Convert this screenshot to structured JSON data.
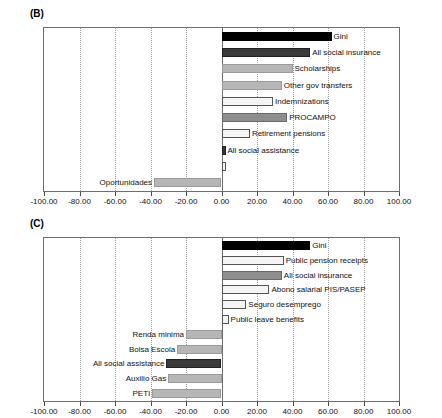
{
  "figure": {
    "panels": [
      {
        "id": "B",
        "label": "(B)",
        "axis": {
          "min": -100,
          "max": 100,
          "ticks": [
            -100,
            -80,
            -60,
            -40,
            -20,
            0,
            20,
            40,
            60,
            80,
            100
          ],
          "tick_labels": [
            "-100.00",
            "-80.00",
            "-60.00",
            "-40.00",
            "-20.00",
            "0.00",
            "20.00",
            "40.00",
            "60.00",
            "80.00",
            "100.00"
          ]
        },
        "bars": [
          {
            "label": "Gini",
            "value": 62,
            "style": "fill-black"
          },
          {
            "label": "All social insurance",
            "value": 50,
            "style": "fill-dark"
          },
          {
            "label": "Scholarships",
            "value": 40,
            "style": "fill-light"
          },
          {
            "label": "Other gov transfers",
            "value": 34,
            "style": "fill-light"
          },
          {
            "label": "Indemnizations",
            "value": 29,
            "style": "fill-hollow"
          },
          {
            "label": "PROCAMPO",
            "value": 37,
            "style": "fill-mid"
          },
          {
            "label": "Retirement pensions",
            "value": 16,
            "style": "fill-hollow"
          },
          {
            "label": "All social assistance",
            "value": 2,
            "style": "fill-dark"
          },
          {
            "label": "",
            "value": 0,
            "style": "fill-hollow"
          },
          {
            "label": "Oportunidades",
            "value": -38,
            "style": "fill-light"
          }
        ]
      },
      {
        "id": "C",
        "label": "(C)",
        "axis": {
          "min": -100,
          "max": 100,
          "ticks": [
            -100,
            -80,
            -60,
            -40,
            -20,
            0,
            20,
            40,
            60,
            80,
            100
          ],
          "tick_labels": [
            "-100.00",
            "-80.00",
            "-60.00",
            "-40.00",
            "-20.00",
            "0.00",
            "20.00",
            "40.00",
            "60.00",
            "80.00",
            "100.00"
          ]
        },
        "bars": [
          {
            "label": "Gini",
            "value": 50,
            "style": "fill-black"
          },
          {
            "label": "Public pension receipts",
            "value": 35,
            "style": "fill-hollow"
          },
          {
            "label": "All social insurance",
            "value": 34,
            "style": "fill-mid"
          },
          {
            "label": "Abono salarial PIS/PASEP",
            "value": 27,
            "style": "fill-hollow"
          },
          {
            "label": "Seguro desemprego",
            "value": 14,
            "style": "fill-hollow"
          },
          {
            "label": "Public leave benefits",
            "value": 4,
            "style": "fill-hollow"
          },
          {
            "label": "Renda minima",
            "value": -20,
            "style": "fill-light"
          },
          {
            "label": "Bolsa Escola",
            "value": -25,
            "style": "fill-light"
          },
          {
            "label": "All social assistance",
            "value": -31,
            "style": "fill-dark"
          },
          {
            "label": "Auxilio Gas",
            "value": -30,
            "style": "fill-light"
          },
          {
            "label": "PETI",
            "value": -39,
            "style": "fill-light"
          }
        ]
      }
    ]
  },
  "chart_data": {
    "type": "bar",
    "orientation": "horizontal",
    "title": "",
    "xlabel": "",
    "ylabel": "",
    "xlim": [
      -100,
      100
    ],
    "grid": true,
    "legend": "none",
    "panels": [
      {
        "panel": "(B)",
        "categories": [
          "Gini",
          "All social insurance",
          "Scholarships",
          "Other gov transfers",
          "Indemnizations",
          "PROCAMPO",
          "Retirement pensions",
          "All social assistance",
          "Oportunidades"
        ],
        "values": [
          62,
          50,
          40,
          34,
          29,
          37,
          16,
          2,
          -38
        ],
        "xticks": [
          -100,
          -80,
          -60,
          -40,
          -20,
          0,
          20,
          40,
          60,
          80,
          100
        ],
        "xticklabels": [
          "-100.00",
          "-80.00",
          "-60.00",
          "-40.00",
          "-20.00",
          "0.00",
          "20.00",
          "40.00",
          "60.00",
          "80.00",
          "100.00"
        ]
      },
      {
        "panel": "(C)",
        "categories": [
          "Gini",
          "Public pension receipts",
          "All social insurance",
          "Abono salarial PIS/PASEP",
          "Seguro desemprego",
          "Public leave benefits",
          "Renda minima",
          "Bolsa Escola",
          "All social assistance",
          "Auxilio Gas",
          "PETI"
        ],
        "values": [
          50,
          35,
          34,
          27,
          14,
          4,
          -20,
          -25,
          -31,
          -30,
          -39
        ],
        "xticks": [
          -100,
          -80,
          -60,
          -40,
          -20,
          0,
          20,
          40,
          60,
          80,
          100
        ],
        "xticklabels": [
          "-100.00",
          "-80.00",
          "-60.00",
          "-40.00",
          "-20.00",
          "0.00",
          "20.00",
          "40.00",
          "60.00",
          "80.00",
          "100.00"
        ]
      }
    ]
  }
}
